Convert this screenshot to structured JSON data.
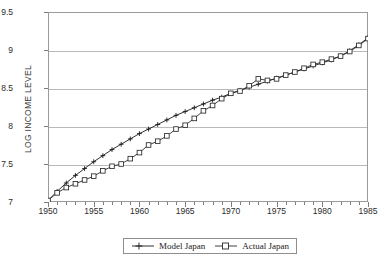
{
  "chart_data": {
    "type": "line",
    "title": "",
    "xlabel": "",
    "ylabel": "LOG INCOME LEVEL",
    "xlim": [
      1950,
      1985
    ],
    "ylim": [
      7,
      9.5
    ],
    "grid": true,
    "legend_position": "bottom-center",
    "x": [
      1950,
      1951,
      1952,
      1953,
      1954,
      1955,
      1956,
      1957,
      1958,
      1959,
      1960,
      1961,
      1962,
      1963,
      1964,
      1965,
      1966,
      1967,
      1968,
      1969,
      1970,
      1971,
      1972,
      1973,
      1974,
      1975,
      1976,
      1977,
      1978,
      1979,
      1980,
      1981,
      1982,
      1983,
      1984,
      1985
    ],
    "xtick_labels": [
      "1950",
      "1955",
      "1960",
      "1965",
      "1970",
      "1975",
      "1980",
      "1985"
    ],
    "xtick_values": [
      1950,
      1955,
      1960,
      1965,
      1970,
      1975,
      1980,
      1985
    ],
    "ytick_labels": [
      "7",
      "7.5",
      "8",
      "8.5",
      "9",
      "9.5"
    ],
    "ytick_values": [
      7,
      7.5,
      8,
      8.5,
      9,
      9.5
    ],
    "series": [
      {
        "name": "Model Japan",
        "marker": "plus",
        "color": "#1a1a1a",
        "values": [
          7.02,
          7.14,
          7.25,
          7.35,
          7.44,
          7.53,
          7.61,
          7.69,
          7.76,
          7.83,
          7.9,
          7.96,
          8.02,
          8.08,
          8.14,
          8.19,
          8.24,
          8.29,
          8.34,
          8.38,
          8.43,
          8.47,
          8.51,
          8.55,
          8.59,
          8.63,
          8.67,
          8.71,
          8.75,
          8.79,
          8.83,
          8.87,
          8.92,
          8.99,
          9.07,
          9.16
        ]
      },
      {
        "name": "Actual Japan",
        "marker": "square",
        "color": "#2b2b2b",
        "values": [
          7.02,
          7.12,
          7.19,
          7.24,
          7.29,
          7.34,
          7.41,
          7.47,
          7.5,
          7.57,
          7.65,
          7.75,
          7.8,
          7.87,
          7.96,
          8.01,
          8.1,
          8.2,
          8.27,
          8.36,
          8.43,
          8.46,
          8.53,
          8.62,
          8.6,
          8.62,
          8.67,
          8.71,
          8.76,
          8.81,
          8.84,
          8.88,
          8.92,
          8.98,
          9.06,
          9.15
        ]
      }
    ]
  }
}
